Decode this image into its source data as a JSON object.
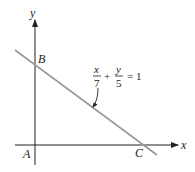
{
  "diagram": {
    "axes": {
      "x_label": "x",
      "y_label": "y"
    },
    "points": {
      "A": "A",
      "B": "B",
      "C": "C"
    },
    "equation": {
      "term1_num": "x",
      "term1_den": "7",
      "plus": "+",
      "term2_num": "y",
      "term2_den": "5",
      "rhs": "= 1"
    },
    "colors": {
      "axis": "#222222",
      "line": "#999999"
    }
  }
}
